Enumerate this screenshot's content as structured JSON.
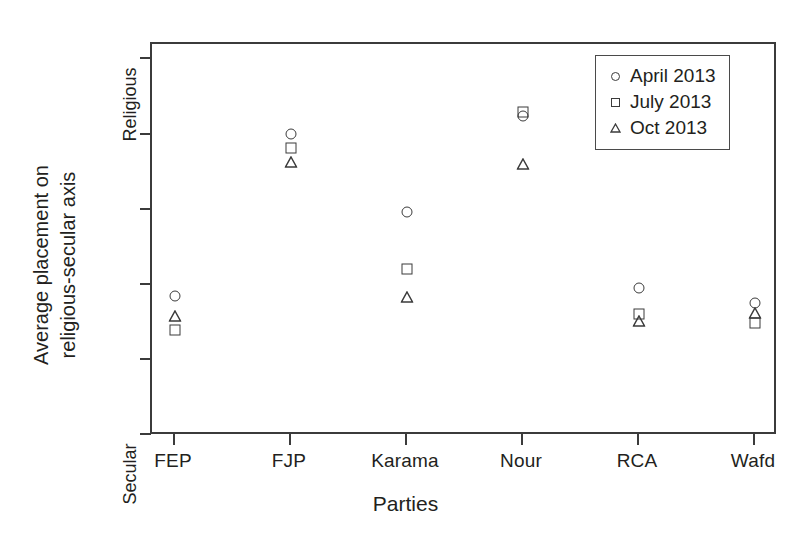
{
  "chart_data": {
    "type": "scatter",
    "title": "",
    "xlabel": "Parties",
    "ylabel_line1": "Average placement on",
    "ylabel_line2": "religious-secular axis",
    "categories": [
      "FEP",
      "FJP",
      "Karama",
      "Nour",
      "RCA",
      "Wafd"
    ],
    "y_axis": {
      "top_label": "Religious",
      "bottom_label": "Secular",
      "ylim": [
        0,
        10
      ],
      "tick_values": [
        10,
        8,
        6,
        4,
        2,
        0
      ],
      "tick_labels": [
        "Religious",
        "",
        "",
        "",
        "",
        "Secular"
      ],
      "grid": false
    },
    "legend": {
      "position": "top-right",
      "entries": [
        {
          "name": "April 2013",
          "marker": "circle"
        },
        {
          "name": "July 2013",
          "marker": "square"
        },
        {
          "name": "Oct 2013",
          "marker": "triangle"
        }
      ]
    },
    "series": [
      {
        "name": "April 2013",
        "marker": "circle",
        "values": [
          3.71,
          8.01,
          5.93,
          8.48,
          3.92,
          3.51
        ]
      },
      {
        "name": "July 2013",
        "marker": "square",
        "values": [
          2.78,
          7.63,
          4.41,
          8.6,
          3.23,
          2.98
        ]
      },
      {
        "name": "Oct 2013",
        "marker": "triangle",
        "values": [
          3.16,
          7.25,
          3.68,
          7.2,
          3.04,
          3.24
        ]
      }
    ]
  },
  "legend": {
    "items": [
      {
        "label": "April 2013"
      },
      {
        "label": "July 2013"
      },
      {
        "label": "Oct 2013"
      }
    ]
  },
  "axes": {
    "x_title": "Parties",
    "y_title_line1": "Average placement on",
    "y_title_line2": "religious-secular axis",
    "y_top": "Religious",
    "y_bottom": "Secular",
    "x_categories": [
      "FEP",
      "FJP",
      "Karama",
      "Nour",
      "RCA",
      "Wafd"
    ]
  },
  "style": {
    "ink": "#231f20",
    "frame": "#3b3b3b",
    "background": "#ffffff"
  }
}
